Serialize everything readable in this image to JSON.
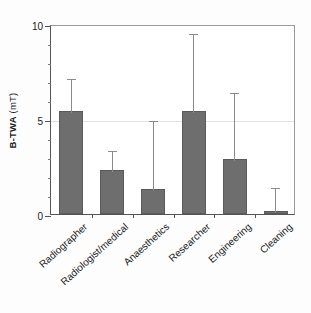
{
  "chart_data": {
    "type": "bar",
    "title": "",
    "xlabel": "",
    "ylabel": "B-TWA (mT)",
    "ylabel_strong": "B-TWA",
    "ylabel_light": "(mT)",
    "categories": [
      "Radiographer",
      "Radiologist/medical",
      "Anaesthetics",
      "Researcher",
      "Engineering",
      "Cleaning"
    ],
    "values": [
      5.4,
      2.3,
      1.3,
      5.4,
      2.9,
      0.15
    ],
    "error_upper": [
      7.2,
      3.4,
      5.0,
      9.6,
      6.5,
      1.5
    ],
    "series": [
      {
        "name": "B-TWA",
        "values": [
          5.4,
          2.3,
          1.3,
          5.4,
          2.9,
          0.15
        ]
      }
    ],
    "ylim": [
      0,
      10
    ],
    "ytick_labels": [
      "0",
      "5",
      "10"
    ],
    "ytick_values": [
      0,
      5,
      10
    ],
    "yminor_values": [
      1,
      2,
      3,
      4,
      6,
      7,
      8,
      9
    ],
    "grid": true,
    "gridline_values": [
      5
    ],
    "legend": "none",
    "bar_color": "#6e6e6e",
    "error_color": "#8a8a8a",
    "axis_color": "#555555"
  }
}
